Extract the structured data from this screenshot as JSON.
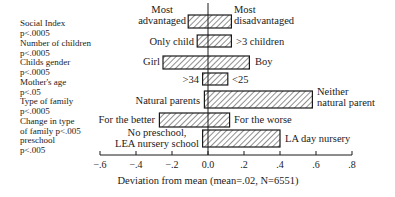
{
  "chart_data": {
    "type": "bar",
    "orientation": "horizontal-diverging",
    "title": "",
    "xlabel": "Deviation from mean (mean=.02, N=6551)",
    "ylabel": "",
    "xlim": [
      -0.6,
      0.8
    ],
    "xticks": [
      -0.6,
      -0.4,
      -0.2,
      0.0,
      0.2,
      0.4,
      0.6,
      0.8
    ],
    "xtick_labels": [
      "−.6",
      "−.4",
      "−.2",
      "0.0",
      ".2",
      ".4",
      ".6",
      ".8"
    ],
    "grid": false,
    "fill_pattern": "diagonal-hatch",
    "categories": [
      {
        "factor": "Social Index",
        "p": "p<.0005",
        "left_label": "Most advantaged",
        "right_label": "Most disadvantaged",
        "low": -0.11,
        "high": 0.13
      },
      {
        "factor": "Number of children",
        "p": "p<.0005",
        "left_label": "Only child",
        "right_label": ">3 children",
        "low": -0.06,
        "high": 0.13
      },
      {
        "factor": "Childs gender",
        "p": "p<.0005",
        "left_label": "Girl",
        "right_label": "Boy",
        "low": -0.25,
        "high": 0.23
      },
      {
        "factor": "Mother's age",
        "p": "p<.05",
        "left_label": ">34",
        "right_label": "<25",
        "low": -0.03,
        "high": 0.11
      },
      {
        "factor": "Type of family",
        "p": "p<.0005",
        "left_label": "Natural parents",
        "right_label": "Neither natural parent",
        "low": -0.02,
        "high": 0.58
      },
      {
        "factor": "Change in type of family",
        "p": "p<.005",
        "left_label": "For the better",
        "right_label": "For the worse",
        "low": -0.27,
        "high": 0.12
      },
      {
        "factor": "preschool",
        "p": "p<.005",
        "left_label": "No preschool, LEA nursery school",
        "right_label": "LA day nursery",
        "low": -0.03,
        "high": 0.4
      }
    ]
  },
  "factors": [
    {
      "line1": "Social Index",
      "line2": "p<.0005"
    },
    {
      "line1": "Number of children",
      "line2": "p<.0005"
    },
    {
      "line1": "Childs gender",
      "line2": "p<.0005"
    },
    {
      "line1": "Mother's age",
      "line2": "p<.05"
    },
    {
      "line1": "Type of family",
      "line2": "p<.0005"
    },
    {
      "line1": "Change in type",
      "line2": "of family p<.005"
    },
    {
      "line1": "preschool",
      "line2": "p<.005"
    }
  ],
  "bar_labels": {
    "social_left_1": "Most",
    "social_left_2": "advantaged",
    "social_right_1": "Most",
    "social_right_2": "disadvantaged",
    "children_left": "Only child",
    "children_right": ">3 children",
    "gender_left": "Girl",
    "gender_right": "Boy",
    "age_left": ">34",
    "age_right": "<25",
    "family_left": "Natural parents",
    "family_right_1": "Neither",
    "family_right_2": "natural parent",
    "change_left": "For the better",
    "change_right": "For the worse",
    "preschool_left_1": "No preschool,",
    "preschool_left_2": "LEA nursery school",
    "preschool_right": "LA day nursery"
  },
  "axis": {
    "ticks": [
      "−.6",
      "−.4",
      "−.2",
      "0.0",
      ".2",
      ".4",
      ".6",
      ".8"
    ],
    "xlabel": "Deviation from mean (mean=.02, N=6551)"
  },
  "colors": {
    "ink": "#1a1a1a",
    "background": "#ffffff"
  }
}
